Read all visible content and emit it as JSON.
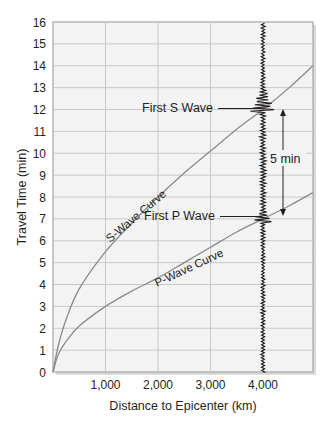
{
  "chart_data": {
    "type": "line",
    "title": "",
    "xlabel": "Distance to Epicenter (km)",
    "ylabel": "Travel Time (min)",
    "xlim": [
      0,
      4950
    ],
    "ylim": [
      0,
      16
    ],
    "grid": true,
    "x_ticks": [
      1000,
      2000,
      3000,
      4000
    ],
    "x_tick_labels": [
      "1,000",
      "2,000",
      "3,000",
      "4,000"
    ],
    "y_ticks": [
      0,
      1,
      2,
      3,
      4,
      5,
      6,
      7,
      8,
      9,
      10,
      11,
      12,
      13,
      14,
      15,
      16
    ],
    "y_tick_labels": [
      "0",
      "1",
      "2",
      "3",
      "4",
      "5",
      "6",
      "7",
      "8",
      "9",
      "10",
      "11",
      "12",
      "13",
      "14",
      "15",
      "16"
    ],
    "series": [
      {
        "name": "S-Wave Curve",
        "x": [
          0,
          100,
          250,
          500,
          1000,
          1500,
          2000,
          2500,
          3000,
          3500,
          4000,
          4500,
          4950
        ],
        "values": [
          0,
          1.2,
          2.4,
          3.8,
          5.5,
          6.8,
          8.0,
          9.1,
          10.1,
          11.1,
          12.0,
          13.0,
          14.0
        ]
      },
      {
        "name": "P-Wave Curve",
        "x": [
          0,
          100,
          250,
          500,
          1000,
          1500,
          2000,
          2500,
          3000,
          3500,
          4000,
          4500,
          4950
        ],
        "values": [
          0,
          0.8,
          1.4,
          2.1,
          3.0,
          3.7,
          4.3,
          5.0,
          5.7,
          6.4,
          7.0,
          7.6,
          8.2
        ]
      }
    ],
    "annotations": [
      {
        "text": "First S Wave",
        "x": 4000,
        "y": 12
      },
      {
        "text": "First P Wave",
        "x": 4000,
        "y": 7
      },
      {
        "text": "5 min",
        "description": "double arrow between P arrival (7 min) and S arrival (12 min)"
      },
      {
        "text": "S-Wave Curve",
        "description": "label along S curve"
      },
      {
        "text": "P-Wave Curve",
        "description": "label along P curve"
      }
    ],
    "seismogram": {
      "x": 4000,
      "p_arrival_min": 7,
      "s_arrival_min": 12
    }
  },
  "labels": {
    "xlabel": "Distance to Epicenter (km)",
    "ylabel": "Travel Time (min)",
    "s_curve": "S-Wave Curve",
    "p_curve": "P-Wave Curve",
    "first_s": "First S Wave",
    "first_p": "First P Wave",
    "interval": "5 min"
  },
  "colors": {
    "background": "#ffffff",
    "plot_bg": "#f3f3f3",
    "grid": "#c8c8c8",
    "axis": "#9a9a9a",
    "curve": "#8a8a8a",
    "ink": "#231f20"
  }
}
